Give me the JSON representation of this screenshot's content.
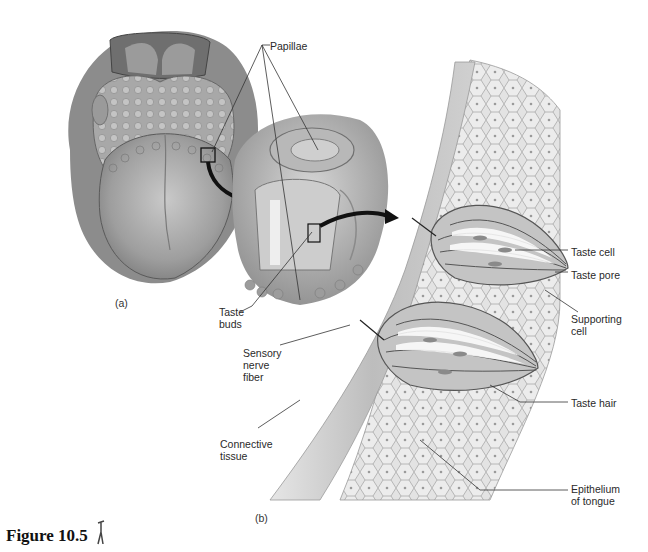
{
  "figure": {
    "caption": "Figure 10.5",
    "icon": "stick-figure-icon"
  },
  "panels": {
    "a": "(a)",
    "b": "(b)"
  },
  "labels": {
    "papillae": "Papillae",
    "taste_buds": "Taste\nbuds",
    "sensory_nerve_fiber": "Sensory\nnerve\nfiber",
    "connective_tissue": "Connective\ntissue",
    "taste_cell": "Taste cell",
    "taste_pore": "Taste pore",
    "supporting_cell": "Supporting\ncell",
    "taste_hair": "Taste hair",
    "epithelium_of_tongue": "Epithelium\nof tongue"
  },
  "colors": {
    "tissue_light": "#d9d9d9",
    "tissue_mid": "#b3b3b3",
    "tissue_dark": "#7a7a7a",
    "outline": "#555555",
    "arrow": "#111111",
    "leader_line": "#333333"
  }
}
